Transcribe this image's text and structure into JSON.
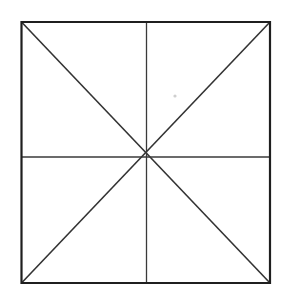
{
  "figure": {
    "name": "square-with-medians-and-diagonals",
    "canvas": {
      "width": 281,
      "height": 291,
      "background_color": "#ffffff"
    },
    "colors": {
      "outline_stroke": "#1f1f1f",
      "median_stroke": "#3a3a3a",
      "diagonal_stroke": "#333333",
      "speck": "#cfcfcf"
    },
    "stroke_widths": {
      "outline": 2.2,
      "median": 1.3,
      "diagonal": 1.6
    },
    "square": {
      "left": 21.5,
      "top": 22.0,
      "right": 270.0,
      "bottom": 283.0,
      "width": 248.5,
      "height": 261.0,
      "corners": {
        "top_left": [
          21.5,
          22.0
        ],
        "top_right": [
          270.0,
          22.0
        ],
        "bottom_right": [
          270.0,
          283.0
        ],
        "bottom_left": [
          21.5,
          283.0
        ]
      }
    },
    "center_node": {
      "label": "center-intersection",
      "x": 146.5,
      "y": 157.0,
      "converging_line_count": 8
    },
    "medians": [
      {
        "name": "vertical-median",
        "orientation": "vertical",
        "x1": 146.5,
        "y1": 22.0,
        "x2": 146.5,
        "y2": 283.0
      },
      {
        "name": "horizontal-median",
        "orientation": "horizontal",
        "x1": 21.5,
        "y1": 157.0,
        "x2": 270.0,
        "y2": 157.0
      }
    ],
    "diagonals": [
      {
        "name": "diagonal-tl-br",
        "from": "top_left",
        "to": "bottom_right",
        "x1": 21.5,
        "y1": 22.0,
        "x2": 270.0,
        "y2": 283.0
      },
      {
        "name": "diagonal-tr-bl",
        "from": "top_right",
        "to": "bottom_left",
        "x1": 270.0,
        "y1": 22.0,
        "x2": 21.5,
        "y2": 283.0
      }
    ],
    "artifacts": [
      {
        "name": "scan-speck",
        "x": 175.0,
        "y": 96.0,
        "radius": 1.6
      }
    ]
  }
}
